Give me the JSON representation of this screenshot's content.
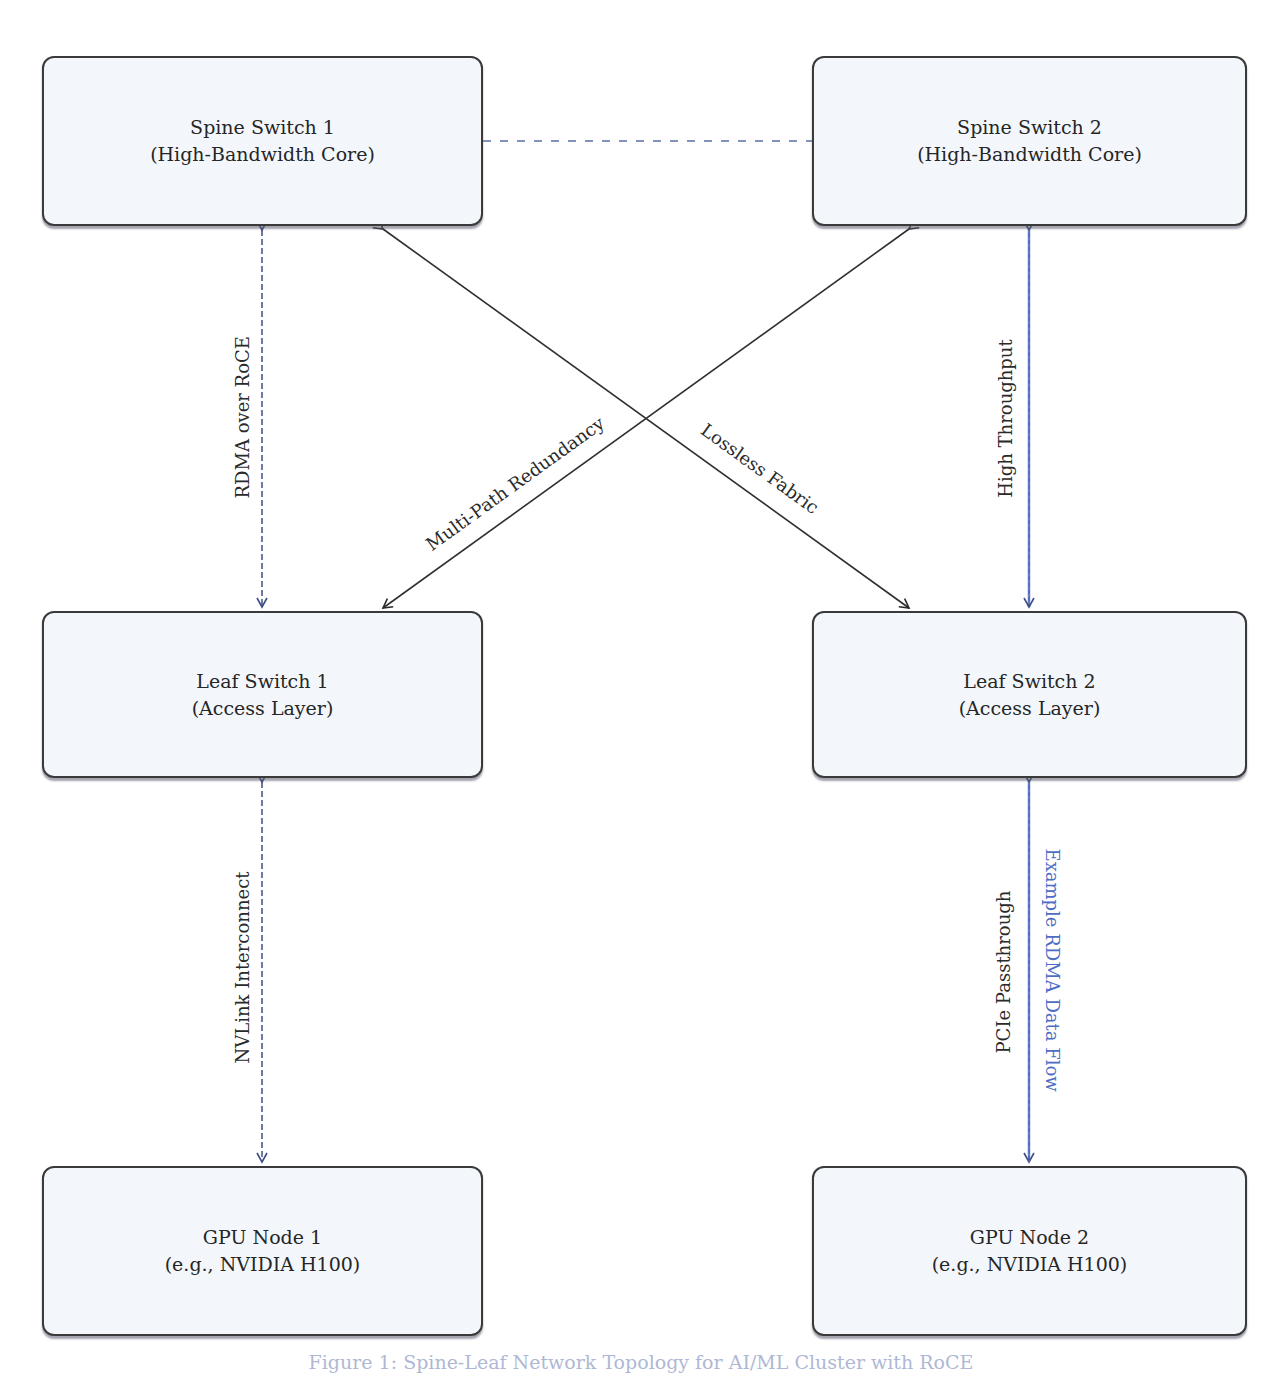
{
  "diagram": {
    "type": "network-topology",
    "nodes": [
      {
        "id": "spine1",
        "title": "Spine Switch 1",
        "subtitle": "(High-Bandwidth Core)"
      },
      {
        "id": "spine2",
        "title": "Spine Switch 2",
        "subtitle": "(High-Bandwidth Core)"
      },
      {
        "id": "leaf1",
        "title": "Leaf Switch 1",
        "subtitle": "(Access Layer)"
      },
      {
        "id": "leaf2",
        "title": "Leaf Switch 2",
        "subtitle": "(Access Layer)"
      },
      {
        "id": "gpu1",
        "title": "GPU Node 1",
        "subtitle": "(e.g., NVIDIA H100)"
      },
      {
        "id": "gpu2",
        "title": "GPU Node 2",
        "subtitle": "(e.g., NVIDIA H100)"
      }
    ],
    "edges": [
      {
        "from": "spine1",
        "to": "spine2",
        "style": "dashed",
        "label": ""
      },
      {
        "from": "spine1",
        "to": "leaf1",
        "style": "dashed-bidirectional",
        "label": "RDMA over RoCE"
      },
      {
        "from": "spine2",
        "to": "leaf2",
        "style": "solid-blue-bidirectional",
        "label": "High Throughput"
      },
      {
        "from": "spine2",
        "to": "leaf1",
        "style": "solid-bidirectional",
        "label": "Multi-Path Redundancy"
      },
      {
        "from": "spine1",
        "to": "leaf2",
        "style": "solid-bidirectional",
        "label": "Lossless Fabric"
      },
      {
        "from": "leaf1",
        "to": "gpu1",
        "style": "dashed-bidirectional",
        "label": "NVLink Interconnect"
      },
      {
        "from": "leaf2",
        "to": "gpu2",
        "style": "solid-blue-bidirectional",
        "label": "PCIe Passthrough",
        "secondary_label": "Example RDMA Data Flow"
      }
    ],
    "caption": "Figure 1: Spine-Leaf Network Topology for AI/ML Cluster with RoCE"
  },
  "colors": {
    "node_fill": "#f3f7fc",
    "node_border": "#3a3a3a",
    "accent_blue": "#4d6cc4",
    "edge_dark": "#333333"
  }
}
